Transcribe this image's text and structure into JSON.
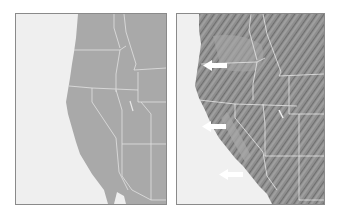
{
  "figure": {
    "panels": [
      {
        "id": "left",
        "description": "Plain political map of the western United States (state outlines only)",
        "land_color": "#a9a9a9",
        "ocean_color": "#efefef",
        "border_color": "#e2e2e2"
      },
      {
        "id": "right",
        "description": "Shaded-relief physical map of the western United States with arrows pointing at the coastline",
        "land_color": "#8e8e8e",
        "ocean_color": "#f0f0f0",
        "border_color": "#e6e6e6",
        "arrows": [
          {
            "label": "arrow-oregon-coast",
            "direction": "left"
          },
          {
            "label": "arrow-northern-california-coast",
            "direction": "left"
          },
          {
            "label": "arrow-southern-california-coast",
            "direction": "left"
          }
        ],
        "arrow_color": "#ffffff"
      }
    ]
  }
}
